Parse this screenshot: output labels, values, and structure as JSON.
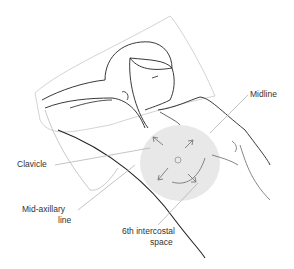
{
  "figure": {
    "shaded_region_color": "#e6e6e6",
    "line_color": "#222222",
    "leader_color": "#a8a8a8"
  },
  "labels": {
    "midline": "Midline",
    "clavicle": "Clavicle",
    "mid_axillary_line_1": "Mid-axillary",
    "mid_axillary_line_2": "line",
    "intercostal_1": "6th intercostal",
    "intercostal_2": "space"
  }
}
